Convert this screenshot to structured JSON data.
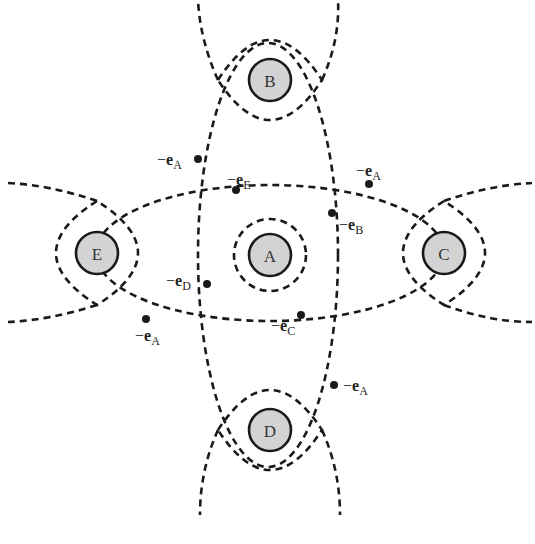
{
  "diagram": {
    "nodes": [
      {
        "id": "A",
        "label": "A",
        "cx": 270,
        "cy": 255
      },
      {
        "id": "B",
        "label": "B",
        "cx": 270,
        "cy": 80
      },
      {
        "id": "C",
        "label": "C",
        "cx": 444,
        "cy": 253
      },
      {
        "id": "D",
        "label": "D",
        "cx": 270,
        "cy": 430
      },
      {
        "id": "E",
        "label": "E",
        "cx": 97,
        "cy": 253
      }
    ],
    "vectors": [
      {
        "id": "eA-top",
        "minus": "−",
        "symbol": "e",
        "subscript": "A",
        "point": [
          198,
          159
        ]
      },
      {
        "id": "eE",
        "minus": "−",
        "symbol": "e",
        "subscript": "E",
        "point": [
          236,
          190
        ]
      },
      {
        "id": "eA-right",
        "minus": "−",
        "symbol": "e",
        "subscript": "A",
        "point": [
          369,
          184
        ]
      },
      {
        "id": "eB",
        "minus": "−",
        "symbol": "e",
        "subscript": "B",
        "point": [
          332,
          213
        ]
      },
      {
        "id": "eD",
        "minus": "−",
        "symbol": "e",
        "subscript": "D",
        "point": [
          207,
          284
        ]
      },
      {
        "id": "eA-left",
        "minus": "−",
        "symbol": "e",
        "subscript": "A",
        "point": [
          146,
          319
        ]
      },
      {
        "id": "eC",
        "minus": "−",
        "symbol": "e",
        "subscript": "C",
        "point": [
          301,
          315
        ]
      },
      {
        "id": "eA-bottom",
        "minus": "−",
        "symbol": "e",
        "subscript": "A",
        "point": [
          334,
          385
        ]
      }
    ],
    "colors": {
      "node_fill": "#d3d3d3",
      "stroke": "#1a1a1a",
      "background": "#ffffff"
    }
  }
}
